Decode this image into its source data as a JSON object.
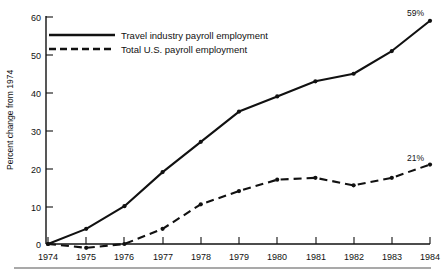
{
  "chart_data": {
    "type": "line",
    "title": "",
    "xlabel": "",
    "ylabel": "Percent change from 1974",
    "categories": [
      "1974",
      "1975",
      "1976",
      "1977",
      "1978",
      "1979",
      "1980",
      "1981",
      "1982",
      "1983",
      "1984"
    ],
    "x": [
      1974,
      1975,
      1976,
      1977,
      1978,
      1979,
      1980,
      1981,
      1982,
      1983,
      1984
    ],
    "xlim": [
      1974,
      1984
    ],
    "ylim": [
      0,
      60
    ],
    "yticks": [
      0,
      10,
      20,
      30,
      40,
      50,
      60
    ],
    "ytick_labels": [
      "0",
      "10",
      "20",
      "30",
      "40",
      "50",
      "60"
    ],
    "xtick_labels": [
      "1974",
      "1975",
      "1976",
      "1977",
      "1978",
      "1979",
      "1980",
      "1981",
      "1982",
      "1983",
      "1984"
    ],
    "grid": false,
    "legend_position": "top-left-inside",
    "series": [
      {
        "name": "Travel industry payroll employment",
        "style": "solid",
        "values": [
          0,
          4,
          10,
          19,
          27,
          35,
          39,
          43,
          45,
          51,
          59
        ]
      },
      {
        "name": "Total U.S. payroll employment",
        "style": "dashed",
        "values": [
          0,
          -1,
          0,
          4,
          10.5,
          14,
          17,
          17.5,
          15.5,
          17.5,
          21
        ]
      }
    ],
    "annotations": [
      {
        "text": "59%",
        "series": "Travel industry payroll employment",
        "x": 1984,
        "y": 59
      },
      {
        "text": "21%",
        "series": "Total U.S. payroll employment",
        "x": 1984,
        "y": 21
      }
    ]
  },
  "legend": {
    "items": [
      {
        "label": "Travel industry payroll employment",
        "style": "solid"
      },
      {
        "label": "Total U.S. payroll employment",
        "style": "dashed"
      }
    ]
  },
  "colors": {
    "ink": "#111111",
    "rule": "#555555",
    "background": "#ffffff"
  }
}
